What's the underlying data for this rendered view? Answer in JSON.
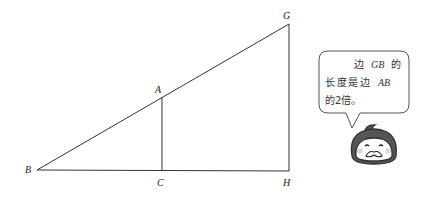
{
  "diagram": {
    "vertices": {
      "B": {
        "label": "B",
        "x": 37,
        "y": 170
      },
      "C": {
        "label": "C",
        "x": 162,
        "y": 171
      },
      "A": {
        "label": "A",
        "x": 162,
        "y": 97
      },
      "G": {
        "label": "G",
        "x": 289,
        "y": 24
      },
      "H": {
        "label": "H",
        "x": 289,
        "y": 171
      }
    },
    "segments": [
      "BG",
      "BH",
      "GH",
      "AC"
    ],
    "line_color": "#333333"
  },
  "speech_bubble": {
    "line1_prefix": "边",
    "line1_italic": "GB",
    "line1_suffix": "的",
    "line2_prefix": "长度是边",
    "line2_italic": "AB",
    "line3": "的2倍。"
  },
  "character": {
    "name": "penguin-mascot",
    "cheek_color": "#d9d9d9"
  }
}
